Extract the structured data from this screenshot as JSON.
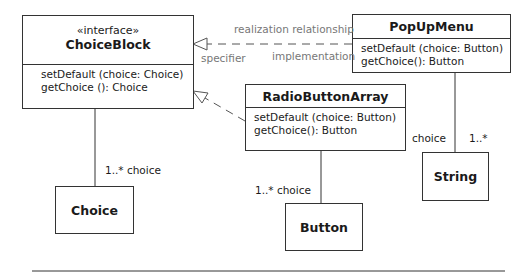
{
  "diagram": {
    "classes": {
      "choice_block": {
        "stereotype": "«interface»",
        "name": "ChoiceBlock",
        "operations": [
          "setDefault (choice: Choice)",
          "getChoice (): Choice"
        ]
      },
      "popup_menu": {
        "name": "PopUpMenu",
        "operations": [
          "setDefault (choice: Button)",
          "getChoice(): Button"
        ]
      },
      "radio_button_array": {
        "name": "RadioButtonArray",
        "operations": [
          "setDefault (choice: Button)",
          "getChoice(): Button"
        ]
      },
      "choice": {
        "name": "Choice"
      },
      "button": {
        "name": "Button"
      },
      "string": {
        "name": "String"
      }
    },
    "labels": {
      "realization_relationship": "realization relationship",
      "specifier": "specifier",
      "implementation": "implementation",
      "choiceblock_choice_mult": "1..* choice",
      "radio_button_mult": "1..* choice",
      "popup_string_role": "choice",
      "popup_string_mult": "1..*"
    }
  }
}
